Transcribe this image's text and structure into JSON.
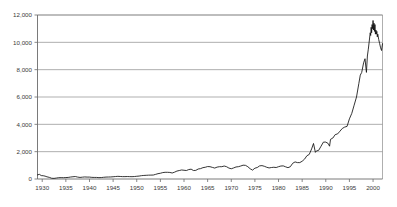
{
  "chart_data": {
    "type": "line",
    "title": "",
    "subtitle": "",
    "xlabel": "",
    "ylabel": "",
    "xlim": [
      1929,
      2002
    ],
    "ylim": [
      0,
      12000
    ],
    "grid": true,
    "legend": null,
    "y_ticks": [
      0,
      2000,
      4000,
      6000,
      8000,
      10000,
      12000
    ],
    "y_tick_labels": [
      "0",
      "2,000",
      "4,000",
      "6,000",
      "8,000",
      "10,000",
      "12,000"
    ],
    "x_ticks": [
      1930,
      1935,
      1940,
      1945,
      1950,
      1955,
      1960,
      1965,
      1970,
      1975,
      1980,
      1985,
      1990,
      1995,
      2000
    ],
    "x_tick_labels": [
      "1930",
      "1935",
      "1940",
      "1945",
      "1950",
      "1955",
      "1960",
      "1965",
      "1970",
      "1975",
      "1980",
      "1985",
      "1990",
      "1995",
      "2000"
    ],
    "series": [
      {
        "name": "index-level",
        "color": "#111111",
        "x": [
          1929.0,
          1929.4,
          1929.8,
          1930.2,
          1930.6,
          1931.0,
          1931.5,
          1932.0,
          1932.5,
          1933.0,
          1933.5,
          1934.0,
          1934.5,
          1935.0,
          1935.5,
          1936.0,
          1936.5,
          1937.0,
          1937.5,
          1938.0,
          1938.5,
          1939.0,
          1939.5,
          1940.0,
          1940.5,
          1941.0,
          1941.5,
          1942.0,
          1942.5,
          1943.0,
          1943.5,
          1944.0,
          1944.5,
          1945.0,
          1945.5,
          1946.0,
          1946.5,
          1947.0,
          1947.5,
          1948.0,
          1948.5,
          1949.0,
          1949.5,
          1950.0,
          1950.5,
          1951.0,
          1951.5,
          1952.0,
          1952.5,
          1953.0,
          1953.5,
          1954.0,
          1954.5,
          1955.0,
          1955.5,
          1956.0,
          1956.5,
          1957.0,
          1957.5,
          1958.0,
          1958.5,
          1959.0,
          1959.5,
          1960.0,
          1960.5,
          1961.0,
          1961.5,
          1962.0,
          1962.5,
          1963.0,
          1963.5,
          1964.0,
          1964.5,
          1965.0,
          1965.5,
          1966.0,
          1966.5,
          1967.0,
          1967.5,
          1968.0,
          1968.5,
          1969.0,
          1969.5,
          1970.0,
          1970.5,
          1971.0,
          1971.5,
          1972.0,
          1972.5,
          1973.0,
          1973.5,
          1974.0,
          1974.5,
          1975.0,
          1975.5,
          1976.0,
          1976.5,
          1977.0,
          1977.5,
          1978.0,
          1978.5,
          1979.0,
          1979.5,
          1980.0,
          1980.5,
          1981.0,
          1981.5,
          1982.0,
          1982.5,
          1983.0,
          1983.5,
          1984.0,
          1984.5,
          1985.0,
          1985.5,
          1986.0,
          1986.5,
          1987.0,
          1987.4,
          1987.8,
          1988.0,
          1988.5,
          1989.0,
          1989.5,
          1990.0,
          1990.5,
          1990.8,
          1991.0,
          1991.5,
          1992.0,
          1992.5,
          1993.0,
          1993.5,
          1994.0,
          1994.5,
          1995.0,
          1995.5,
          1996.0,
          1996.5,
          1997.0,
          1997.3,
          1997.6,
          1998.0,
          1998.3,
          1998.6,
          1998.8,
          1999.0,
          1999.2,
          1999.4,
          1999.5,
          1999.6,
          1999.7,
          1999.8,
          1999.9,
          2000.0,
          2000.1,
          2000.2,
          2000.3,
          2000.4,
          2000.5,
          2000.6,
          2000.7,
          2000.8,
          2000.9,
          2001.0,
          2001.2,
          2001.4,
          2001.6,
          2001.8,
          2002.0
        ],
        "y": [
          300,
          340,
          250,
          240,
          210,
          160,
          120,
          55,
          45,
          70,
          95,
          100,
          95,
          105,
          115,
          145,
          165,
          180,
          140,
          115,
          135,
          150,
          140,
          140,
          120,
          115,
          115,
          100,
          105,
          125,
          140,
          145,
          150,
          165,
          180,
          195,
          185,
          175,
          175,
          180,
          175,
          170,
          180,
          200,
          215,
          245,
          260,
          270,
          280,
          285,
          290,
          340,
          390,
          420,
          470,
          490,
          490,
          480,
          440,
          500,
          580,
          620,
          660,
          640,
          620,
          690,
          720,
          620,
          630,
          730,
          760,
          830,
          860,
          910,
          900,
          850,
          800,
          870,
          900,
          900,
          950,
          900,
          800,
          750,
          810,
          880,
          900,
          950,
          1010,
          1000,
          900,
          750,
          650,
          790,
          840,
          960,
          980,
          930,
          860,
          810,
          840,
          860,
          840,
          900,
          950,
          960,
          890,
          830,
          900,
          1150,
          1250,
          1200,
          1200,
          1300,
          1450,
          1700,
          1800,
          2200,
          2600,
          1950,
          2050,
          2100,
          2400,
          2700,
          2700,
          2600,
          2400,
          2900,
          3000,
          3250,
          3300,
          3500,
          3700,
          3800,
          3850,
          4400,
          4800,
          5400,
          6000,
          7000,
          7600,
          7800,
          8500,
          8800,
          7800,
          9000,
          9500,
          10100,
          10700,
          10500,
          11100,
          10700,
          11300,
          11000,
          11600,
          10900,
          11400,
          10800,
          11300,
          10600,
          10900,
          10600,
          10800,
          10400,
          10600,
          10200,
          9900,
          9600,
          9400,
          9900
        ]
      }
    ]
  },
  "axes": {
    "y_axis_name": "value-axis",
    "x_axis_name": "year-axis"
  }
}
